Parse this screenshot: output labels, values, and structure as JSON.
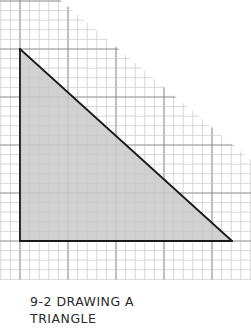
{
  "caption": {
    "line1": "9-2 DRAWING A",
    "line2": "TRIANGLE"
  },
  "diagram": {
    "type": "graph-paper-triangle",
    "grid": {
      "origin_x": 20,
      "origin_y": 49,
      "cell": 9.6,
      "major_every": 5,
      "minor_color": "#c8c8c8",
      "major_color": "#8a8a8a"
    },
    "triangle": {
      "vertices": [
        [
          20,
          49
        ],
        [
          20,
          241
        ],
        [
          232,
          241
        ]
      ],
      "fill": "#c9c9c9",
      "stroke": "#1a1a1a"
    },
    "colors": {
      "background": "#ffffff",
      "text": "#2a2a2a"
    }
  }
}
